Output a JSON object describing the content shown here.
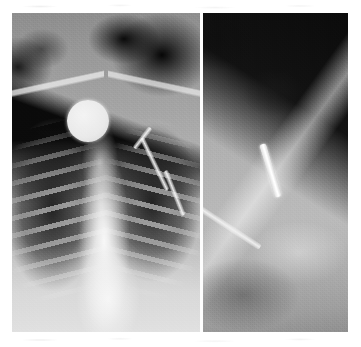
{
  "figure": {
    "kind": "radiograph-figure",
    "modality": "X-ray",
    "body_region": "chest / right supraclavicular region",
    "panel_count": 2,
    "colorspace": "grayscale",
    "caption": "",
    "background_color": "#ffffff",
    "frame": {
      "x": 12,
      "y": 13,
      "width": 336,
      "height": 319
    }
  },
  "panels": [
    {
      "id": "panel-frontal",
      "label": "",
      "view": "AP chest radiograph",
      "width": 188,
      "height": 319,
      "tones": {
        "darkest": "#060606",
        "soft_tissue": "#a5a5a5",
        "mediastinum": "#f0f0f0",
        "brightest": "#ffffff"
      },
      "findings": [
        {
          "name": "circular-radiopaque-marker",
          "description": "round metallic density over the right supraclavicular region",
          "shape": "circle",
          "center": [
            76,
            108
          ],
          "radius": 21,
          "tone": "#eaeaea"
        },
        {
          "name": "catheter-shaft",
          "description": "bright linear device shaft crossing the left clavicle toward the mediastinum",
          "shape": "line-segments",
          "tone": "#f8f8f8"
        },
        {
          "name": "rib-cage",
          "description": "bilateral posterior rib ladders over aerated lung fields",
          "shape": "repeating-bands"
        },
        {
          "name": "lung-fields",
          "description": "bilateral dark aerated lung",
          "tone": "#141414"
        },
        {
          "name": "clavicles",
          "description": "bilateral clavicular shadows",
          "tone": "#eeeeee"
        }
      ]
    },
    {
      "id": "panel-detail",
      "label": "",
      "view": "coned-down oblique detail of the right supraclavicular region",
      "width": 145,
      "height": 319,
      "tones": {
        "darkest": "#080808",
        "soft_tissue": "#b0b0b0",
        "brightest": "#ffffff"
      },
      "findings": [
        {
          "name": "retained-metallic-fragment",
          "description": "short bright linear metallic fragment, obliquely oriented",
          "shape": "rod",
          "center": [
            64,
            157
          ],
          "length": 55,
          "angle_deg": -17,
          "tone": "#ffffff"
        },
        {
          "name": "device-shaft",
          "description": "bright linear sheath/dilator shaft running to the lower left",
          "shape": "rod",
          "angle_deg": -57,
          "tone": "#f4f4f4"
        },
        {
          "name": "air-wedge",
          "description": "dark air wedge occupying the upper-right of the field",
          "tone": "#090909"
        }
      ]
    }
  ],
  "separator": {
    "name": "panel-divider",
    "color": "#fdfdfd",
    "width_px": 3
  },
  "artifacts": {
    "name": "scan-speckle",
    "description": "faint grey scanner speckle in the white margins above and below the plates"
  }
}
